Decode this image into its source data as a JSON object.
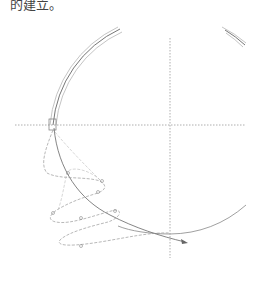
{
  "caption": "的建立。",
  "diagram": {
    "type": "orbit-spiral-diagram",
    "center": [
      170,
      125
    ],
    "radius": 117,
    "axis_color": "#999999",
    "line_color": "#666666",
    "dash_color": "#9a9a9a"
  }
}
